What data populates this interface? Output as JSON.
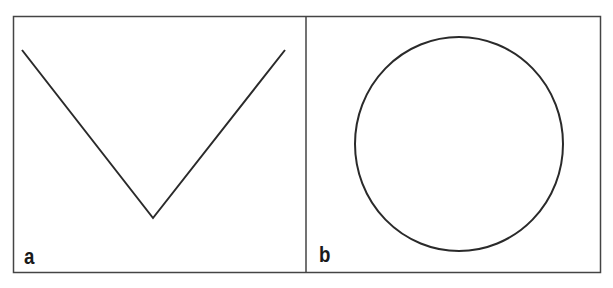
{
  "figure": {
    "stroke_color": "#2a2a2a",
    "panels": [
      {
        "label": "a",
        "shape": "v-shape",
        "points": [
          [
            22,
            50
          ],
          [
            153,
            218
          ],
          [
            285,
            50
          ]
        ]
      },
      {
        "label": "b",
        "shape": "circle",
        "center": [
          459,
          144
        ],
        "rx": 104,
        "ry": 107
      }
    ]
  }
}
